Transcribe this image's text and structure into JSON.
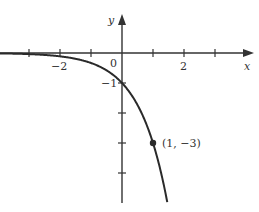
{
  "chart_data": {
    "type": "line",
    "title": "",
    "function": "y = -3^x",
    "xlabel": "x",
    "ylabel": "y",
    "origin_label": "0",
    "x_tick_labels": [
      {
        "value": -2,
        "label": "−2"
      },
      {
        "value": 2,
        "label": "2"
      }
    ],
    "y_tick_labels": [
      {
        "value": -1,
        "label": "−1"
      }
    ],
    "x_ticks": [
      -3,
      -2,
      -1,
      1,
      2,
      3
    ],
    "y_ticks": [
      -1,
      -2,
      -3,
      -4
    ],
    "xlim": [
      -4,
      4
    ],
    "ylim": [
      -5,
      1.2
    ],
    "grid": false,
    "legend": null,
    "highlighted_point": {
      "x": 1,
      "y": -3,
      "label": "(1, −3)"
    },
    "series": [
      {
        "name": "y = -3^x",
        "x": [
          -4,
          -3,
          -2,
          -1.5,
          -1,
          -0.5,
          0,
          0.5,
          1,
          1.3,
          1.5
        ],
        "y": [
          -0.012,
          -0.037,
          -0.111,
          -0.192,
          -0.333,
          -0.577,
          -1,
          -1.732,
          -3,
          -4.17,
          -5.2
        ]
      }
    ],
    "color": "#2a2a2a"
  }
}
